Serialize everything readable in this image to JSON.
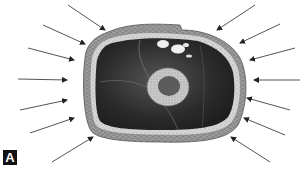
{
  "figure": {
    "panel_label": "A",
    "colors": {
      "skin": "#8a8a8a",
      "fat": "#cfcfcf",
      "muscle": "#2e2e2e",
      "bone_cortex": "#bdbdbd",
      "marrow": "#5a5a5a",
      "arrow": "#555555",
      "background": "#ffffff"
    },
    "arrows_left": [
      {
        "x1": 68,
        "y1": 5,
        "x2": 105,
        "y2": 30
      },
      {
        "x1": 43,
        "y1": 25,
        "x2": 85,
        "y2": 44
      },
      {
        "x1": 28,
        "y1": 48,
        "x2": 74,
        "y2": 60
      },
      {
        "x1": 18,
        "y1": 79,
        "x2": 67,
        "y2": 80
      },
      {
        "x1": 20,
        "y1": 110,
        "x2": 67,
        "y2": 100
      },
      {
        "x1": 30,
        "y1": 133,
        "x2": 74,
        "y2": 118
      },
      {
        "x1": 52,
        "y1": 162,
        "x2": 93,
        "y2": 137
      }
    ],
    "arrows_right": [
      {
        "x1": 255,
        "y1": 5,
        "x2": 217,
        "y2": 30
      },
      {
        "x1": 280,
        "y1": 24,
        "x2": 240,
        "y2": 43
      },
      {
        "x1": 295,
        "y1": 48,
        "x2": 250,
        "y2": 60
      },
      {
        "x1": 300,
        "y1": 80,
        "x2": 254,
        "y2": 80
      },
      {
        "x1": 290,
        "y1": 110,
        "x2": 247,
        "y2": 98
      },
      {
        "x1": 285,
        "y1": 135,
        "x2": 244,
        "y2": 118
      },
      {
        "x1": 270,
        "y1": 162,
        "x2": 231,
        "y2": 137
      }
    ]
  }
}
